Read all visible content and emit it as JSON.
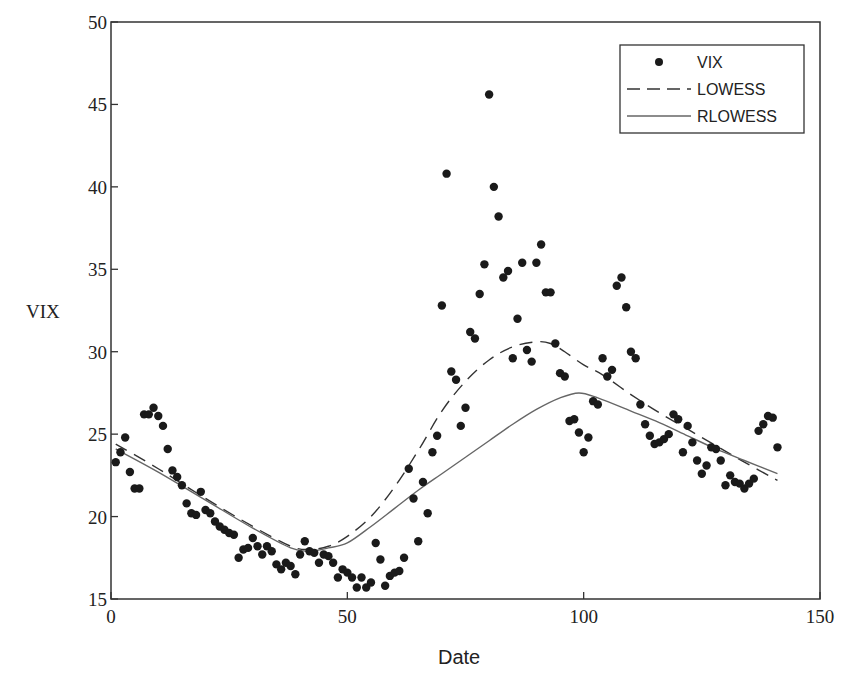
{
  "chart_data": {
    "type": "scatter",
    "title": "",
    "xlabel": "Date",
    "ylabel": "VIX",
    "xlim": [
      0,
      150
    ],
    "ylim": [
      15,
      50
    ],
    "xticks": [
      0,
      50,
      100,
      150
    ],
    "yticks": [
      15,
      20,
      25,
      30,
      35,
      40,
      45,
      50
    ],
    "grid": false,
    "legend_position": "upper right",
    "series": [
      {
        "name": "VIX",
        "kind": "markers",
        "x": [
          1,
          2,
          3,
          4,
          5,
          6,
          7,
          8,
          9,
          10,
          11,
          12,
          13,
          14,
          15,
          16,
          17,
          18,
          19,
          20,
          21,
          22,
          23,
          24,
          25,
          26,
          27,
          28,
          29,
          30,
          31,
          32,
          33,
          34,
          35,
          36,
          37,
          38,
          39,
          40,
          41,
          42,
          43,
          44,
          45,
          46,
          47,
          48,
          49,
          50,
          51,
          52,
          53,
          54,
          55,
          56,
          57,
          58,
          59,
          60,
          61,
          62,
          63,
          64,
          65,
          66,
          67,
          68,
          69,
          70,
          71,
          72,
          73,
          74,
          75,
          76,
          77,
          78,
          79,
          80,
          81,
          82,
          83,
          84,
          85,
          86,
          87,
          88,
          89,
          90,
          91,
          92,
          93,
          94,
          95,
          96,
          97,
          98,
          99,
          100,
          101,
          102,
          103,
          104,
          105,
          106,
          107,
          108,
          109,
          110,
          111,
          112,
          113,
          114,
          115,
          116,
          117,
          118,
          119,
          120,
          121,
          122,
          123,
          124,
          125,
          126,
          127,
          128,
          129,
          130,
          131,
          132,
          133,
          134,
          135,
          136,
          137,
          138,
          139,
          140,
          141
        ],
        "y": [
          23.3,
          23.9,
          24.8,
          22.7,
          21.7,
          21.7,
          26.2,
          26.2,
          26.6,
          26.1,
          25.5,
          24.1,
          22.8,
          22.4,
          21.9,
          20.8,
          20.2,
          20.1,
          21.5,
          20.4,
          20.2,
          19.7,
          19.4,
          19.2,
          19.0,
          18.9,
          17.5,
          18.0,
          18.1,
          18.7,
          18.2,
          17.7,
          18.2,
          17.9,
          17.1,
          16.8,
          17.2,
          17.0,
          16.5,
          17.7,
          18.5,
          17.9,
          17.8,
          17.2,
          17.7,
          17.6,
          17.2,
          16.3,
          16.8,
          16.6,
          16.3,
          15.7,
          16.3,
          15.7,
          16.0,
          18.4,
          17.4,
          15.8,
          16.4,
          16.6,
          16.7,
          17.5,
          22.9,
          21.1,
          18.5,
          22.1,
          20.2,
          23.9,
          24.9,
          32.8,
          40.8,
          28.8,
          28.3,
          25.5,
          26.6,
          31.2,
          30.8,
          33.5,
          35.3,
          45.6,
          40.0,
          38.2,
          34.5,
          34.9,
          29.6,
          32.0,
          35.4,
          30.1,
          29.4,
          35.4,
          36.5,
          33.6,
          33.6,
          30.5,
          28.7,
          28.5,
          25.8,
          25.9,
          25.1,
          23.9,
          24.8,
          27.0,
          26.8,
          29.6,
          28.5,
          28.9,
          34.0,
          34.5,
          32.7,
          30.0,
          29.6,
          26.8,
          25.6,
          24.9,
          24.4,
          24.5,
          24.7,
          25.0,
          26.2,
          25.9,
          23.9,
          25.5,
          24.5,
          23.4,
          22.6,
          23.1,
          24.2,
          24.1,
          23.4,
          21.9,
          22.5,
          22.1,
          22.0,
          21.7,
          22.0,
          22.3,
          25.2,
          25.6,
          26.1,
          26.0,
          24.2
        ]
      },
      {
        "name": "LOWESS",
        "kind": "dashed-line",
        "x": [
          1,
          10,
          20,
          30,
          38,
          42,
          46,
          50,
          55,
          60,
          65,
          70,
          75,
          80,
          85,
          90,
          93,
          96,
          100,
          104,
          110,
          116,
          122,
          128,
          134,
          141
        ],
        "y": [
          24.4,
          22.9,
          21.1,
          19.4,
          18.2,
          18.0,
          18.2,
          18.8,
          20.0,
          21.8,
          24.0,
          26.4,
          28.2,
          29.5,
          30.3,
          30.6,
          30.5,
          30.0,
          29.2,
          28.6,
          27.4,
          26.3,
          25.3,
          24.3,
          23.3,
          22.2
        ]
      },
      {
        "name": "RLOWESS",
        "kind": "solid-line",
        "x": [
          1,
          10,
          20,
          30,
          38,
          42,
          46,
          50,
          55,
          60,
          65,
          70,
          75,
          80,
          85,
          90,
          95,
          99,
          103,
          110,
          116,
          122,
          128,
          134,
          141
        ],
        "y": [
          24.1,
          22.7,
          21.0,
          19.3,
          18.1,
          17.9,
          18.1,
          18.4,
          19.4,
          20.5,
          21.6,
          22.6,
          23.6,
          24.6,
          25.6,
          26.5,
          27.2,
          27.5,
          27.2,
          26.4,
          25.7,
          24.9,
          24.1,
          23.4,
          22.6
        ]
      }
    ]
  },
  "legend": {
    "items": [
      {
        "label": "VIX"
      },
      {
        "label": "LOWESS"
      },
      {
        "label": "RLOWESS"
      }
    ]
  },
  "axes": {
    "xlabel": "Date",
    "ylabel": "VIX",
    "xtick_labels": [
      "0",
      "50",
      "100",
      "150"
    ],
    "ytick_labels": [
      "15",
      "20",
      "25",
      "30",
      "35",
      "40",
      "45",
      "50"
    ]
  },
  "colors": {
    "marker": "#1a1a1a",
    "lowess": "#333333",
    "rlowess": "#666666",
    "axis": "#333333"
  }
}
